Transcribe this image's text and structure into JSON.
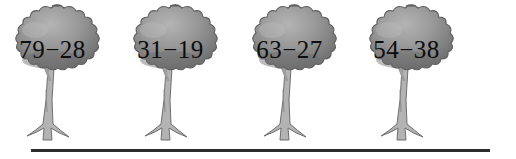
{
  "worksheet": {
    "background_color": "#ffffff",
    "ground_line_color": "#2b2b2b",
    "canopy_color": "#989898",
    "canopy_shadow_color": "#6a6a6a",
    "trunk_color": "#b0b0b0",
    "text_color": "#0d0d0d"
  },
  "trees": [
    {
      "expression": "79−28",
      "minuend": 79,
      "subtrahend": 28,
      "operator": "−",
      "left": 5
    },
    {
      "expression": "31−19",
      "minuend": 31,
      "subtrahend": 19,
      "operator": "−",
      "left": 123
    },
    {
      "expression": "63−27",
      "minuend": 63,
      "subtrahend": 27,
      "operator": "−",
      "left": 242
    },
    {
      "expression": "54−38",
      "minuend": 54,
      "subtrahend": 38,
      "operator": "−",
      "left": 359
    }
  ]
}
